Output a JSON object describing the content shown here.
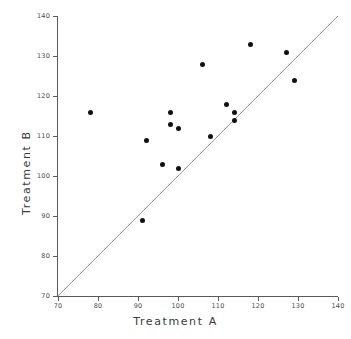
{
  "chart_data": {
    "type": "scatter",
    "title": "",
    "xlabel": "Treatment A",
    "ylabel": "Treatment B",
    "xlim": [
      70,
      140
    ],
    "ylim": [
      70,
      140
    ],
    "xticks": [
      70,
      80,
      90,
      100,
      110,
      120,
      130,
      140
    ],
    "yticks": [
      70,
      80,
      90,
      100,
      110,
      120,
      130,
      140
    ],
    "grid": false,
    "legend": null,
    "point_color": "#111111",
    "line_color": "#808080",
    "reference_line": {
      "name": "identity-line",
      "equation": "y = x",
      "from": [
        70,
        70
      ],
      "to": [
        140,
        140
      ]
    },
    "points": [
      {
        "x": 78,
        "y": 116
      },
      {
        "x": 91,
        "y": 89
      },
      {
        "x": 92,
        "y": 109
      },
      {
        "x": 96,
        "y": 103
      },
      {
        "x": 98,
        "y": 116
      },
      {
        "x": 98,
        "y": 113
      },
      {
        "x": 100,
        "y": 112
      },
      {
        "x": 100,
        "y": 102
      },
      {
        "x": 106,
        "y": 128
      },
      {
        "x": 108,
        "y": 110
      },
      {
        "x": 112,
        "y": 118
      },
      {
        "x": 114,
        "y": 116
      },
      {
        "x": 114,
        "y": 114
      },
      {
        "x": 118,
        "y": 133
      },
      {
        "x": 127,
        "y": 131
      },
      {
        "x": 129,
        "y": 124
      }
    ]
  }
}
